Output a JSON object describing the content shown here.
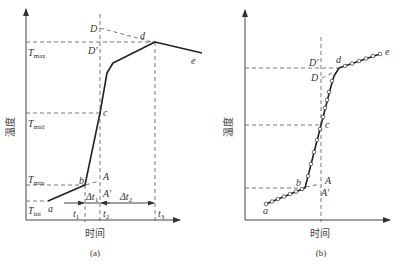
{
  "panel_a": {
    "caption": "(a)",
    "ylabel": "温度",
    "xlabel": "时间",
    "y_levels": {
      "T_max": {
        "label": "T",
        "sub": "max"
      },
      "T_mid": {
        "label": "T",
        "sub": "mid"
      },
      "T_min": {
        "label": "T",
        "sub": "min"
      },
      "T_int": {
        "label": "T",
        "sub": "int"
      }
    },
    "points": {
      "a": "a",
      "b": "b",
      "c": "c",
      "d": "d",
      "e": "e",
      "A": "A",
      "A_prime": "A′",
      "D": "D",
      "D_prime": "D′"
    },
    "time_ticks": {
      "t1": {
        "label": "t",
        "sub": "1"
      },
      "t2": {
        "label": "t",
        "sub": "2"
      },
      "t3": {
        "label": "t",
        "sub": "3"
      }
    },
    "intervals": {
      "dt1": {
        "label": "Δt",
        "sub": "1"
      },
      "dt2": {
        "label": "Δt",
        "sub": "2"
      }
    }
  },
  "panel_b": {
    "caption": "(b)",
    "ylabel": "温度",
    "xlabel": "时间",
    "points": {
      "a": "a",
      "b": "b",
      "c": "c",
      "d": "d",
      "e": "e",
      "A": "A",
      "A_prime": "A′",
      "D": "D",
      "D_prime": "D′"
    }
  }
}
